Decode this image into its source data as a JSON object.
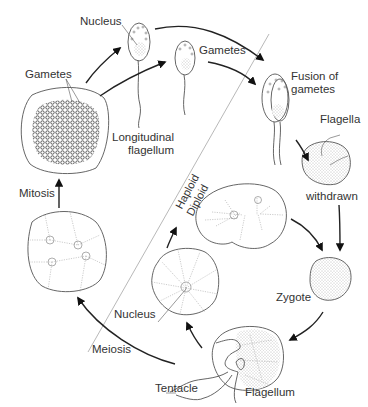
{
  "diagram": {
    "type": "life-cycle",
    "phase_divider": {
      "upper_label": "Haploid",
      "lower_label": "Diploid"
    },
    "labels": {
      "nucleus_top": "Nucleus",
      "gametes_left": "Gametes",
      "gametes_top": "Gametes",
      "longitudinal_1": "Longitudinal",
      "longitudinal_2": "flagellum",
      "fusion_1": "Fusion of",
      "fusion_2": "gametes",
      "flagella": "Flagella",
      "withdrawn": "withdrawn",
      "mitosis": "Mitosis",
      "zygote": "Zygote",
      "nucleus_bottom": "Nucleus",
      "meiosis": "Meiosis",
      "tentacle": "Tentacle",
      "flagellum": "Flagellum"
    },
    "stages": [
      {
        "id": "gametangium",
        "desc": "Cell filled with gametes"
      },
      {
        "id": "gamete-1",
        "desc": "Flagellated gamete with nucleus"
      },
      {
        "id": "gamete-2",
        "desc": "Flagellated gamete"
      },
      {
        "id": "fusing-gametes",
        "desc": "Fusion of gametes"
      },
      {
        "id": "flagella-withdrawn",
        "desc": "Cell with flagella withdrawn"
      },
      {
        "id": "zygote",
        "desc": "Zygote"
      },
      {
        "id": "adult-trophont",
        "desc": "Mature cell with tentacle and flagellum"
      },
      {
        "id": "meiotic-cell",
        "desc": "Cell after meiosis with nucleus"
      },
      {
        "id": "dividing-cell",
        "desc": "Binucleate dividing cell"
      },
      {
        "id": "mitotic-cell",
        "desc": "Multinucleate cell undergoing mitosis"
      }
    ],
    "arrows": [
      {
        "from": "gametangium",
        "to": "gamete-1"
      },
      {
        "from": "gametangium",
        "to": "gamete-2"
      },
      {
        "from": "gamete-1",
        "to": "fusing-gametes"
      },
      {
        "from": "gamete-2",
        "to": "fusing-gametes"
      },
      {
        "from": "fusing-gametes",
        "to": "flagella-withdrawn"
      },
      {
        "from": "flagella-withdrawn",
        "to": "zygote"
      },
      {
        "from": "dividing-cell",
        "to": "zygote"
      },
      {
        "from": "zygote",
        "to": "adult-trophont"
      },
      {
        "from": "adult-trophont",
        "to": "meiotic-cell"
      },
      {
        "from": "meiotic-cell",
        "to": "dividing-cell"
      },
      {
        "from": "adult-trophont",
        "to": "mitotic-cell",
        "label": "Meiosis"
      },
      {
        "from": "mitotic-cell",
        "to": "gametangium",
        "label": "Mitosis"
      }
    ]
  }
}
